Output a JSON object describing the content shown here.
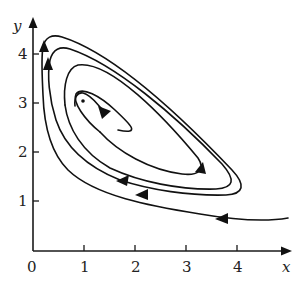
{
  "figure": {
    "type": "phase-portrait",
    "x_axis": {
      "label": "x",
      "origin_label": "0",
      "ticks": [
        "1",
        "2",
        "3",
        "4"
      ]
    },
    "y_axis": {
      "label": "y",
      "ticks": [
        "1",
        "2",
        "3",
        "4"
      ]
    },
    "equilibrium_point": {
      "x": 1,
      "y": 3
    },
    "trajectory_description": "Single trajectory spiraling inward toward the equilibrium point near (1, 3); enters from the lower right near (4.9, 0.7), moving clockwise with arrows indicating direction of motion.",
    "colors": {
      "stroke": "#111111",
      "background": "#ffffff"
    }
  }
}
